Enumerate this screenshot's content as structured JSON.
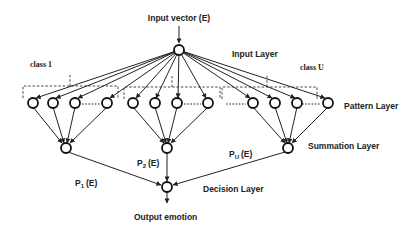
{
  "diagram": {
    "title_input": "Input vector (E)",
    "layers": {
      "input": "Input Layer",
      "pattern": "Pattern Layer",
      "summation": "Summation Layer",
      "decision": "Decision Layer"
    },
    "classes": {
      "first": "class 1",
      "last": "class U"
    },
    "probabilities": {
      "p1": "P",
      "p1_sub": "1",
      "p1_arg": "(E)",
      "p2": "P",
      "p2_sub": "2",
      "p2_arg": "(E)",
      "pu": "P",
      "pu_sub": "U",
      "pu_arg": "(E)"
    },
    "output": "Output emotion",
    "colors": {
      "stroke": "#222222",
      "background": "#ffffff"
    }
  }
}
